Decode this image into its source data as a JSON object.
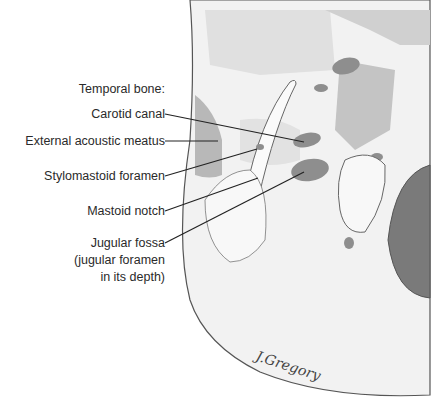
{
  "figure": {
    "heading": "Temporal bone:",
    "labels": [
      {
        "id": "carotid-canal",
        "text": "Carotid canal"
      },
      {
        "id": "external-acoustic-meatus",
        "text": "External acoustic meatus"
      },
      {
        "id": "stylomastoid-foramen",
        "text": "Stylomastoid foramen"
      },
      {
        "id": "mastoid-notch",
        "text": "Mastoid notch"
      },
      {
        "id": "jugular-fossa",
        "text": "Jugular fossa",
        "line2": "(jugular foramen",
        "line3": "in its depth)"
      }
    ],
    "signature": "J.Gregory"
  },
  "colors": {
    "bone": "#f3f3f3",
    "bone_shade": "#dcdcdc",
    "foramen": "#8e8e8e",
    "dark_region": "#7a7a7a",
    "outline": "#555555",
    "text": "#2a2a2a"
  }
}
